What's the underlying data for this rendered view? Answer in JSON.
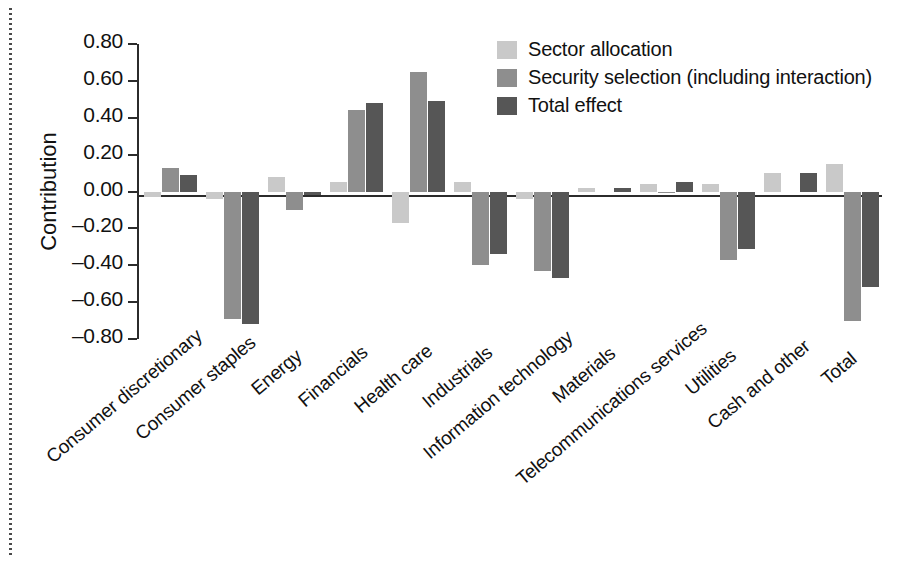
{
  "chart_data": {
    "type": "bar",
    "title": "",
    "xlabel": "",
    "ylabel": "Contribution",
    "ylim": [
      -0.8,
      0.8
    ],
    "ytick_labels": [
      "0.80",
      "0.60",
      "0.40",
      "0.20",
      "0.00",
      "–0.20",
      "–0.40",
      "–0.60",
      "–0.80"
    ],
    "ytick_values": [
      0.8,
      0.6,
      0.4,
      0.2,
      0.0,
      -0.2,
      -0.4,
      -0.6,
      -0.8
    ],
    "grid": false,
    "legend_position": "top-right",
    "categories": [
      "Consumer discretionary",
      "Consumer staples",
      "Energy",
      "Financials",
      "Health care",
      "Industrials",
      "Information technology",
      "Materials",
      "Telecommunications services",
      "Utilities",
      "Cash and other",
      "Total"
    ],
    "series": [
      {
        "name": "Sector allocation",
        "color": "#c9c9c9",
        "values": [
          -0.03,
          -0.04,
          0.08,
          0.05,
          -0.17,
          0.05,
          -0.04,
          0.02,
          0.04,
          0.04,
          0.1,
          0.15
        ]
      },
      {
        "name": "Security selection (including interaction)",
        "color": "#8e8e8e",
        "values": [
          0.13,
          -0.69,
          -0.1,
          0.44,
          0.65,
          -0.4,
          -0.43,
          0.0,
          -0.01,
          -0.37,
          0.0,
          -0.7
        ]
      },
      {
        "name": "Total effect",
        "color": "#565656",
        "values": [
          0.09,
          -0.72,
          -0.02,
          0.48,
          0.49,
          -0.34,
          -0.47,
          0.02,
          0.05,
          -0.31,
          0.1,
          -0.52
        ]
      }
    ]
  }
}
